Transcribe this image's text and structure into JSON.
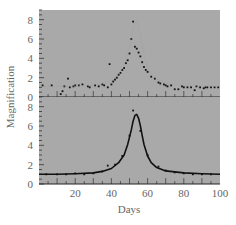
{
  "chart_data": [
    {
      "panel": "top",
      "type": "scatter",
      "title": "",
      "xlabel": "",
      "ylabel": "Magnification",
      "xlim": [
        0,
        100
      ],
      "ylim": [
        0,
        9
      ],
      "yticks": [
        0,
        2,
        4,
        6,
        8
      ],
      "grid": false,
      "background": "#a9a9a9",
      "series": [
        {
          "name": "observed",
          "marker": "dot",
          "x": [
            2,
            7,
            12,
            13,
            14,
            16,
            17,
            19,
            20,
            22,
            24,
            27,
            28,
            31,
            33,
            35,
            36,
            38,
            39,
            40,
            41,
            42,
            43,
            44,
            45,
            46,
            47,
            48,
            49,
            50,
            51,
            52,
            53,
            54,
            55,
            56,
            57,
            58,
            59,
            60,
            62,
            64,
            66,
            67,
            69,
            70,
            71,
            73,
            75,
            77,
            79,
            80,
            82,
            84,
            86,
            87,
            89,
            91,
            92,
            93,
            95,
            97,
            99
          ],
          "y": [
            1.2,
            1.2,
            0.3,
            0.6,
            1.1,
            1.9,
            1.0,
            1.1,
            1.2,
            1.2,
            1.3,
            1.1,
            1.0,
            1.2,
            1.1,
            1.3,
            1.2,
            1.0,
            3.4,
            1.3,
            1.6,
            1.8,
            2.0,
            2.3,
            2.5,
            2.8,
            3.0,
            3.5,
            3.8,
            4.5,
            6.0,
            7.8,
            5.2,
            5.0,
            4.6,
            4.2,
            3.6,
            3.1,
            2.8,
            2.6,
            2.1,
            1.9,
            1.5,
            1.4,
            1.3,
            1.2,
            1.1,
            1.2,
            0.8,
            0.8,
            1.1,
            1.0,
            1.0,
            1.0,
            0.7,
            1.1,
            1.0,
            0.9,
            1.0,
            1.0,
            1.0,
            1.0,
            1.0
          ]
        }
      ]
    },
    {
      "panel": "bottom",
      "type": "line",
      "title": "",
      "xlabel": "Days",
      "ylabel": "Magnification",
      "xlim": [
        0,
        100
      ],
      "ylim": [
        0,
        9
      ],
      "xticks": [
        20,
        40,
        60,
        80,
        100
      ],
      "yticks": [
        0,
        2,
        4,
        6,
        8
      ],
      "grid": false,
      "background": "#a9a9a9",
      "series": [
        {
          "name": "model fit",
          "style": "line",
          "x": [
            0,
            10,
            20,
            30,
            35,
            40,
            44,
            47,
            49,
            51,
            52,
            53,
            54,
            55,
            56,
            57,
            58,
            60,
            62,
            65,
            70,
            80,
            90,
            100
          ],
          "y": [
            1.0,
            1.0,
            1.05,
            1.15,
            1.3,
            1.6,
            2.2,
            3.0,
            4.1,
            5.6,
            6.5,
            7.1,
            7.2,
            6.8,
            6.0,
            5.0,
            4.1,
            2.9,
            2.2,
            1.7,
            1.35,
            1.15,
            1.05,
            1.0
          ]
        },
        {
          "name": "observed",
          "marker": "dot",
          "x": [
            4,
            10,
            15,
            20,
            25,
            30,
            35,
            38,
            42,
            46,
            50,
            52,
            56,
            60,
            66,
            70,
            75,
            80,
            85,
            90,
            95
          ],
          "y": [
            1.0,
            1.0,
            1.0,
            1.1,
            1.0,
            1.1,
            1.3,
            1.9,
            2.0,
            2.9,
            5.0,
            7.6,
            5.5,
            3.0,
            1.8,
            1.4,
            1.2,
            1.1,
            1.0,
            1.0,
            1.0
          ]
        }
      ]
    }
  ],
  "labels": {
    "ylabel": "Magnification",
    "xlabel": "Days",
    "yticks": [
      "0",
      "2",
      "4",
      "6",
      "8"
    ],
    "xticks": [
      "20",
      "40",
      "60",
      "80",
      "100"
    ]
  }
}
